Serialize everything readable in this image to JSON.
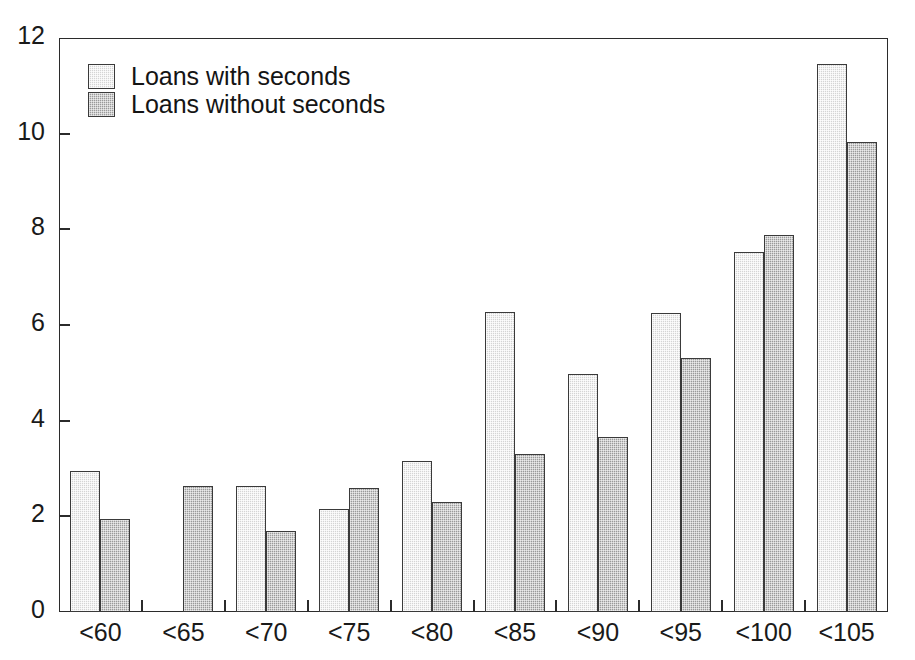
{
  "figure": {
    "clipped_caption_text": "",
    "background_color": "#ffffff",
    "frame_color": "#2b2b2b"
  },
  "legend": {
    "position": "top-left-inside",
    "entries": [
      {
        "label": "Loans with seconds",
        "swatch": "light-gray-swatch",
        "color": "#d4d4d4"
      },
      {
        "label": "Loans without seconds",
        "swatch": "dark-gray-swatch",
        "color": "#9a9a9a"
      }
    ]
  },
  "axes": {
    "y_ticks": [
      "0",
      "2",
      "4",
      "6",
      "8",
      "10",
      "12"
    ],
    "x_ticks": [
      "<60",
      "<65",
      "<70",
      "<75",
      "<80",
      "<85",
      "<90",
      "<95",
      "<100",
      "<105"
    ]
  },
  "chart_data": {
    "type": "bar",
    "title": "",
    "xlabel": "",
    "ylabel": "",
    "ylim": [
      0,
      12
    ],
    "ytick_values": [
      0,
      2,
      4,
      6,
      8,
      10,
      12
    ],
    "grid": false,
    "legend_position": "upper left",
    "categories": [
      "<60",
      "<65",
      "<70",
      "<75",
      "<80",
      "<85",
      "<90",
      "<95",
      "<100",
      "<105"
    ],
    "series": [
      {
        "name": "Loans with seconds",
        "color": "#d4d4d4",
        "values": [
          2.95,
          null,
          2.63,
          2.15,
          3.15,
          6.27,
          4.97,
          6.25,
          7.53,
          11.45
        ]
      },
      {
        "name": "Loans without seconds",
        "color": "#9a9a9a",
        "values": [
          1.94,
          2.63,
          1.7,
          2.6,
          2.3,
          3.3,
          3.65,
          5.3,
          7.88,
          9.82
        ]
      }
    ]
  }
}
